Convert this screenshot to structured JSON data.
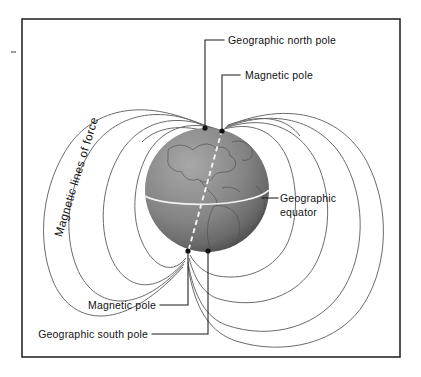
{
  "figure": {
    "title_semantic": "earth-magnetic-field-diagram",
    "background_color": "#ffffff",
    "frame_color": "#2a2a2a"
  },
  "labels": {
    "geographic_north_pole": "Geographic north pole",
    "magnetic_pole_north": "Magnetic pole",
    "geographic_equator_line1": "Geographic",
    "geographic_equator_line2": "equator",
    "magnetic_lines_of_force": "Magnetic lines of force",
    "magnetic_pole_south": "Magnetic pole",
    "geographic_south_pole": "Geographic south pole"
  },
  "icons": {
    "north_geographic_pole_dot": "pole-dot-icon",
    "north_magnetic_pole_dot": "pole-dot-icon",
    "south_magnetic_pole_dot": "pole-dot-icon",
    "south_geographic_pole_dot": "pole-dot-icon",
    "globe": "globe-icon",
    "edge_tick": "edge-tick-icon"
  },
  "colors": {
    "field_line": "#6b6b6b",
    "leader_line": "#1a1a1a",
    "globe_light": "#9c9c9c",
    "globe_mid": "#7e7e7e",
    "globe_dark": "#3f3f3f",
    "equator_line": "#f2f2f2",
    "magnetic_axis": "#f4f4f4",
    "text": "#111111"
  },
  "geometry": {
    "globe_center_x": 207,
    "globe_center_y": 190,
    "globe_radius": 62,
    "field_line_count_per_side": 5,
    "frame_left": 22,
    "frame_top": 19,
    "frame_right": 400,
    "frame_bottom": 357
  }
}
